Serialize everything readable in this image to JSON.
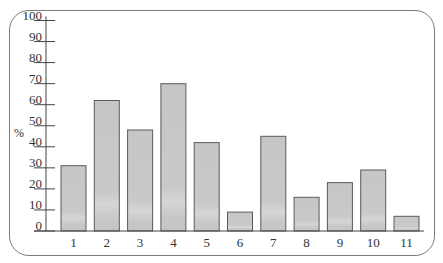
{
  "chart_data": {
    "type": "bar",
    "title": "",
    "xlabel": "",
    "ylabel": "%",
    "ylim": [
      0,
      100
    ],
    "yticks": [
      0,
      10,
      20,
      30,
      40,
      50,
      60,
      70,
      80,
      90,
      100
    ],
    "categories": [
      "1",
      "2",
      "3",
      "4",
      "5",
      "6",
      "7",
      "8",
      "9",
      "10",
      "11"
    ],
    "values": [
      31,
      62,
      48,
      70,
      42,
      9,
      45,
      16,
      23,
      29,
      7
    ],
    "grid": false,
    "legend": null,
    "colors": {
      "bar_fill": "#c6c6c6",
      "bar_fill_light": "#d8d8d8",
      "bar_border": "#5a5a5a",
      "axis": "#444444",
      "frame": "#7a7a7a"
    }
  }
}
